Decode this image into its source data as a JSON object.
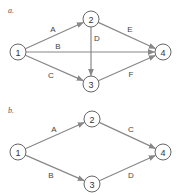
{
  "diagrams": [
    {
      "label": "a.",
      "label_pos": [
        8,
        13
      ],
      "nodes": [
        {
          "id": "1",
          "x": 18,
          "y": 52
        },
        {
          "id": "2",
          "x": 91,
          "y": 19
        },
        {
          "id": "3",
          "x": 91,
          "y": 84
        },
        {
          "id": "4",
          "x": 163,
          "y": 52
        }
      ],
      "edges": [
        {
          "from": "1",
          "to": "2",
          "label": "A",
          "lx": 53,
          "ly": 29
        },
        {
          "from": "1",
          "to": "4",
          "label": "B",
          "lx": 58,
          "ly": 46
        },
        {
          "from": "1",
          "to": "3",
          "label": "C",
          "lx": 51,
          "ly": 75
        },
        {
          "from": "2",
          "to": "3",
          "label": "D",
          "lx": 97,
          "ly": 38
        },
        {
          "from": "2",
          "to": "4",
          "label": "E",
          "lx": 130,
          "ly": 29
        },
        {
          "from": "3",
          "to": "4",
          "label": "F",
          "lx": 131,
          "ly": 74
        }
      ]
    },
    {
      "label": "b.",
      "label_pos": [
        8,
        113
      ],
      "nodes": [
        {
          "id": "1",
          "x": 18,
          "y": 152
        },
        {
          "id": "2",
          "x": 92,
          "y": 119
        },
        {
          "id": "3",
          "x": 92,
          "y": 184
        },
        {
          "id": "4",
          "x": 163,
          "y": 152
        }
      ],
      "edges": [
        {
          "from": "1",
          "to": "2",
          "label": "A",
          "lx": 54,
          "ly": 129
        },
        {
          "from": "1",
          "to": "3",
          "label": "B",
          "lx": 51,
          "ly": 175
        },
        {
          "from": "2",
          "to": "4",
          "label": "C",
          "lx": 131,
          "ly": 129
        },
        {
          "from": "3",
          "to": "4",
          "label": "D",
          "lx": 131,
          "ly": 175
        }
      ]
    }
  ],
  "style": {
    "node_radius": 8,
    "edge_color": "#888888",
    "node_stroke": "#666666"
  }
}
